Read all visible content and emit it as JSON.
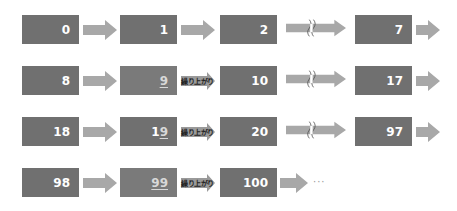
{
  "colors": {
    "box": "#707070",
    "box_text": "#ffffff",
    "arrow": "#a8a8a8",
    "carry_arrow": "#9a9a9a"
  },
  "carry_label": "繰り上がり",
  "ellipsis": "···",
  "rows": [
    {
      "cells": [
        {
          "value": "0",
          "prefix": "",
          "underlined": ""
        },
        {
          "value": "1",
          "prefix": "",
          "underlined": ""
        },
        {
          "value": "2",
          "prefix": "",
          "underlined": ""
        },
        {
          "value": "7",
          "prefix": "",
          "underlined": ""
        }
      ],
      "connectors": [
        "arrow",
        "arrow",
        "break-arrow",
        "arrow"
      ]
    },
    {
      "cells": [
        {
          "value": "8",
          "prefix": "",
          "underlined": ""
        },
        {
          "value": "9",
          "prefix": "",
          "underlined": "9"
        },
        {
          "value": "10",
          "prefix": "",
          "underlined": ""
        },
        {
          "value": "17",
          "prefix": "",
          "underlined": ""
        }
      ],
      "connectors": [
        "arrow",
        "carry-arrow",
        "break-arrow",
        "arrow"
      ]
    },
    {
      "cells": [
        {
          "value": "18",
          "prefix": "",
          "underlined": ""
        },
        {
          "value": "19",
          "prefix": "1",
          "underlined": "9"
        },
        {
          "value": "20",
          "prefix": "",
          "underlined": ""
        },
        {
          "value": "97",
          "prefix": "",
          "underlined": ""
        }
      ],
      "connectors": [
        "arrow",
        "carry-arrow",
        "break-arrow",
        "arrow"
      ]
    },
    {
      "cells": [
        {
          "value": "98",
          "prefix": "",
          "underlined": ""
        },
        {
          "value": "99",
          "prefix": "",
          "underlined": "99"
        },
        {
          "value": "100",
          "prefix": "",
          "underlined": ""
        }
      ],
      "connectors": [
        "arrow",
        "carry-arrow",
        "arrow"
      ]
    }
  ]
}
